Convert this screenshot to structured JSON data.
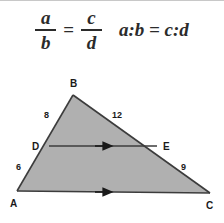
{
  "formula": {
    "fraction_left": {
      "numerator": "a",
      "denominator": "b"
    },
    "equals": "=",
    "fraction_right": {
      "numerator": "c",
      "denominator": "d"
    },
    "ratio_expression": "a:b = c:d"
  },
  "figure": {
    "name": "triangle-abc-with-midsegment-de",
    "fill_color": "#b0b0b0",
    "stroke_color": "#3c3c3c",
    "vertices": [
      {
        "id": "A",
        "label": "A",
        "x": 17,
        "y": 136
      },
      {
        "id": "B",
        "label": "B",
        "x": 73,
        "y": 40
      },
      {
        "id": "C",
        "label": "C",
        "x": 210,
        "y": 138
      }
    ],
    "points": [
      {
        "id": "D",
        "label": "D",
        "x": 49,
        "y": 91,
        "on_segment": "AB"
      },
      {
        "id": "E",
        "label": "E",
        "x": 157,
        "y": 91,
        "on_segment": "BC"
      }
    ],
    "segment_lengths": [
      {
        "id": "BD",
        "value": "8",
        "x": 48,
        "y": 61
      },
      {
        "id": "BE",
        "value": "12",
        "x": 117,
        "y": 61
      },
      {
        "id": "DA",
        "value": "6",
        "x": 20,
        "y": 112
      },
      {
        "id": "EC",
        "value": "9",
        "x": 184,
        "y": 112
      }
    ],
    "parallel_marks": [
      {
        "id": "DE",
        "direction": "right"
      },
      {
        "id": "AC",
        "direction": "right"
      }
    ]
  }
}
